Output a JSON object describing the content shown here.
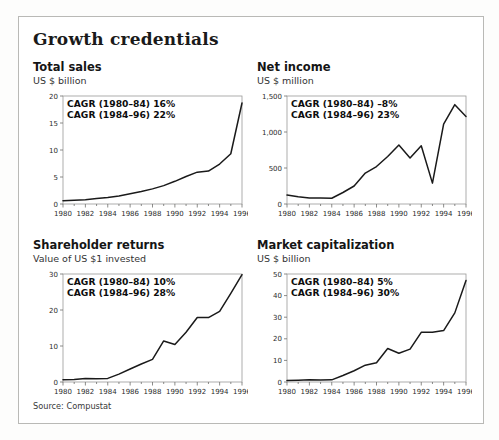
{
  "panel": {
    "title": "Growth credentials",
    "source": "Source: Compustat",
    "border_color": "#b9b9b6",
    "background": "#ffffff"
  },
  "charts": [
    {
      "title": "Total sales",
      "subtitle": "US $ billion",
      "cagr_line_1": "CAGR (1980–84) 16%",
      "cagr_line_2": "CAGR (1984–96) 22%"
    },
    {
      "title": "Net income",
      "subtitle": "US $ million",
      "cagr_line_1": "CAGR (1980–84) –8%",
      "cagr_line_2": "CAGR (1984–96) 23%"
    },
    {
      "title": "Shareholder returns",
      "subtitle": "Value of US $1 invested",
      "cagr_line_1": "CAGR (1980–84) 10%",
      "cagr_line_2": "CAGR (1984–96) 28%"
    },
    {
      "title": "Market capitalization",
      "subtitle": "US $ billion",
      "cagr_line_1": "CAGR (1980–84) 5%",
      "cagr_line_2": "CAGR (1984–96) 30%"
    }
  ],
  "chart_data": [
    {
      "type": "line",
      "title": "Total sales",
      "subtitle": "US $ billion",
      "xlabel": "",
      "ylabel": "US $ billion",
      "x": [
        1980,
        1981,
        1982,
        1983,
        1984,
        1985,
        1986,
        1987,
        1988,
        1989,
        1990,
        1991,
        1992,
        1993,
        1994,
        1995,
        1996
      ],
      "values": [
        0.6,
        0.7,
        0.8,
        1.0,
        1.2,
        1.5,
        1.9,
        2.3,
        2.8,
        3.4,
        4.2,
        5.1,
        5.9,
        6.1,
        7.4,
        9.3,
        11.9
      ],
      "values_note": "final point 1996 rises steeply to 18.7",
      "values_final": 18.7,
      "xlim": [
        1980,
        1996
      ],
      "ylim": [
        0,
        20
      ],
      "yticks": [
        0,
        5,
        10,
        15,
        20
      ],
      "ytick_labels": [
        "0",
        "5",
        "10",
        "15",
        "20"
      ],
      "xticks": [
        1980,
        1982,
        1984,
        1986,
        1988,
        1990,
        1992,
        1994,
        1996
      ],
      "xtick_labels": [
        "1980",
        "1982",
        "1984",
        "1986",
        "1988",
        "1990",
        "1992",
        "1994",
        "1996"
      ],
      "grid": false,
      "legend": "none",
      "annotations": [
        "CAGR (1980–84) 16%",
        "CAGR (1984–96) 22%"
      ],
      "line_color": "#1a1a1a"
    },
    {
      "type": "line",
      "title": "Net income",
      "subtitle": "US $ million",
      "xlabel": "",
      "ylabel": "US $ million",
      "x": [
        1980,
        1981,
        1982,
        1983,
        1984,
        1985,
        1986,
        1987,
        1988,
        1989,
        1990,
        1991,
        1992,
        1993,
        1994,
        1995,
        1996
      ],
      "values": [
        125,
        100,
        85,
        85,
        80,
        160,
        250,
        430,
        520,
        660,
        820,
        640,
        810,
        290,
        1110,
        1380,
        1215
      ],
      "xlim": [
        1980,
        1996
      ],
      "ylim": [
        0,
        1500
      ],
      "yticks": [
        0,
        500,
        1000,
        1500
      ],
      "ytick_labels": [
        "0",
        "500",
        "1,000",
        "1,500"
      ],
      "xticks": [
        1980,
        1982,
        1984,
        1986,
        1988,
        1990,
        1992,
        1994,
        1996
      ],
      "xtick_labels": [
        "1980",
        "1982",
        "1984",
        "1986",
        "1988",
        "1990",
        "1992",
        "1994",
        "1996"
      ],
      "grid": false,
      "legend": "none",
      "annotations": [
        "CAGR (1980–84) –8%",
        "CAGR (1984–96) 23%"
      ],
      "line_color": "#1a1a1a"
    },
    {
      "type": "line",
      "title": "Shareholder returns",
      "subtitle": "Value of US $1 invested",
      "xlabel": "",
      "ylabel": "Value of US $1 invested",
      "x": [
        1980,
        1981,
        1982,
        1983,
        1984,
        1985,
        1986,
        1987,
        1988,
        1989,
        1990,
        1991,
        1992,
        1993,
        1994,
        1995,
        1996
      ],
      "values": [
        0.6,
        0.7,
        1.0,
        0.9,
        1.0,
        2.2,
        3.6,
        5.0,
        6.3,
        11.4,
        10.4,
        13.8,
        17.9,
        17.9,
        19.6,
        24.6,
        29.8
      ],
      "xlim": [
        1980,
        1996
      ],
      "ylim": [
        0,
        30
      ],
      "yticks": [
        0,
        10,
        20,
        30
      ],
      "ytick_labels": [
        "0",
        "10",
        "20",
        "30"
      ],
      "xticks": [
        1980,
        1982,
        1984,
        1986,
        1988,
        1990,
        1992,
        1994,
        1996
      ],
      "xtick_labels": [
        "1980",
        "1982",
        "1984",
        "1986",
        "1988",
        "1990",
        "1992",
        "1994",
        "1996"
      ],
      "grid": false,
      "legend": "none",
      "annotations": [
        "CAGR (1980–84) 10%",
        "CAGR (1984–96) 28%"
      ],
      "line_color": "#1a1a1a"
    },
    {
      "type": "line",
      "title": "Market capitalization",
      "subtitle": "US $ billion",
      "xlabel": "",
      "ylabel": "US $ billion",
      "x": [
        1980,
        1981,
        1982,
        1983,
        1984,
        1985,
        1986,
        1987,
        1988,
        1989,
        1990,
        1991,
        1992,
        1993,
        1994,
        1995,
        1996
      ],
      "values": [
        0.7,
        0.8,
        1.0,
        0.9,
        1.0,
        3.0,
        5.2,
        7.8,
        8.9,
        15.5,
        13.3,
        15.2,
        23.0,
        23.0,
        23.8,
        32.0,
        47.0
      ],
      "xlim": [
        1980,
        1996
      ],
      "ylim": [
        0,
        50
      ],
      "yticks": [
        0,
        10,
        20,
        30,
        40,
        50
      ],
      "ytick_labels": [
        "0",
        "10",
        "20",
        "30",
        "40",
        "50"
      ],
      "xticks": [
        1980,
        1982,
        1984,
        1986,
        1988,
        1990,
        1992,
        1994,
        1996
      ],
      "xtick_labels": [
        "1980",
        "1982",
        "1984",
        "1986",
        "1988",
        "1990",
        "1992",
        "1994",
        "1996"
      ],
      "grid": false,
      "legend": "none",
      "annotations": [
        "CAGR (1980–84) 5%",
        "CAGR (1984–96) 30%"
      ],
      "line_color": "#1a1a1a"
    }
  ]
}
